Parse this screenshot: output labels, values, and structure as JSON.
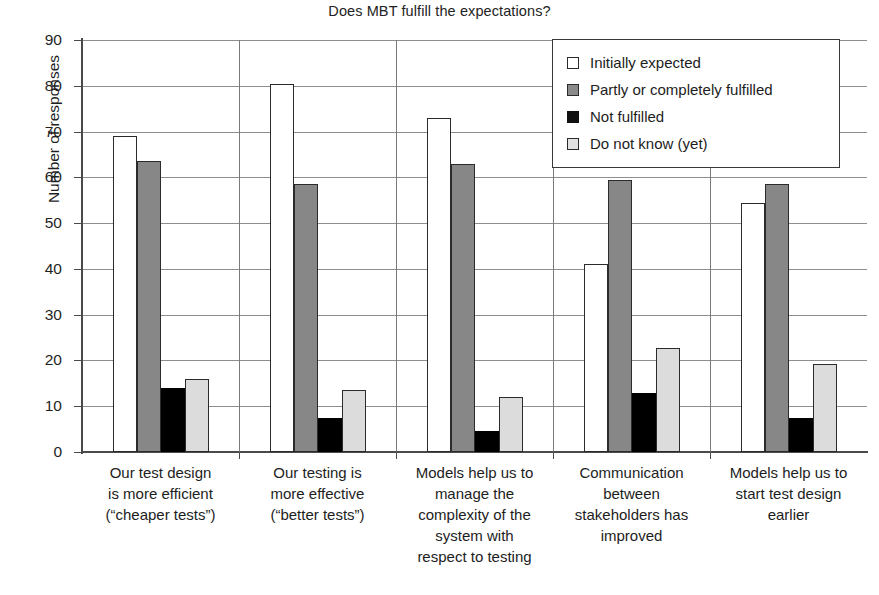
{
  "chart_data": {
    "type": "bar",
    "title": "Does MBT fulfill the expectations?",
    "xlabel": "",
    "ylabel": "Number of responses",
    "ylim": [
      0,
      90
    ],
    "ytick_step": 10,
    "yticks": [
      0,
      10,
      20,
      30,
      40,
      50,
      60,
      70,
      80,
      90
    ],
    "grid": true,
    "legend_position": "top-right-inside",
    "categories": [
      "Our test design is more efficient (“cheaper tests”)",
      "Our testing is more effective (“better tests”)",
      "Models help us to manage the complexity of the system with respect to testing",
      "Communication between stakeholders has improved",
      "Models help us to start test design earlier"
    ],
    "category_lines": [
      [
        "Our test design",
        "is more efficient",
        "(“cheaper tests”)"
      ],
      [
        "Our testing is",
        "more effective",
        "(“better tests”)"
      ],
      [
        "Models help us to",
        "manage the",
        "complexity of the",
        "system with",
        "respect to testing"
      ],
      [
        "Communication",
        "between",
        "stakeholders has",
        "improved"
      ],
      [
        "Models help us to",
        "start test design",
        "earlier"
      ]
    ],
    "series": [
      {
        "name": "Initially expected",
        "color": "#ffffff",
        "values": [
          69,
          80.5,
          73,
          41,
          54.5
        ]
      },
      {
        "name": "Partly or completely fulfilled",
        "color": "#878787",
        "values": [
          63.5,
          58.5,
          63,
          59.5,
          58.5
        ]
      },
      {
        "name": "Not fulfilled",
        "color": "#000000",
        "values": [
          14,
          7.5,
          4.5,
          12.8,
          7.5
        ]
      },
      {
        "name": "Do not know (yet)",
        "color": "#dcdcdc",
        "values": [
          16,
          13.5,
          12,
          22.8,
          19.3
        ]
      }
    ]
  },
  "legend": {
    "items": [
      "Initially expected",
      "Partly or completely fulfilled",
      "Not fulfilled",
      "Do not know (yet)"
    ]
  }
}
